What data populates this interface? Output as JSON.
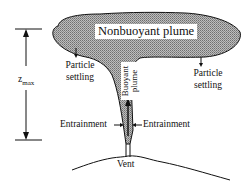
{
  "diagram": {
    "title": "Nonbuoyant plume",
    "buoyant_label_line1": "Buoyant",
    "buoyant_label_line2": "plume",
    "particle_left_line1": "Particle",
    "particle_left_line2": "settling",
    "particle_right_line1": "Particle",
    "particle_right_line2": "settling",
    "entrainment_left": "Entrainment",
    "entrainment_right": "Entrainment",
    "vent": "Vent",
    "zmax_symbol": "z",
    "zmax_sub": "max",
    "colors": {
      "plume_fill": "#9a9a9a",
      "line": "#111111",
      "background": "#ffffff"
    }
  }
}
